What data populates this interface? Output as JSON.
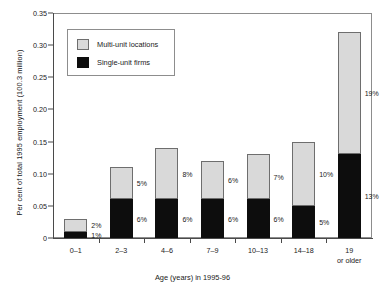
{
  "chart_data": {
    "type": "bar",
    "stacked": true,
    "title": "",
    "xlabel": "Age (years) in 1995-96",
    "ylabel": "Per cent of total 1995 employment (100.3 million)",
    "categories": [
      "0–1",
      "2–3",
      "4–6",
      "7–9",
      "10–13",
      "14–18",
      "19 or older"
    ],
    "ylim": [
      0,
      0.35
    ],
    "ytick_labels": [
      "0",
      "0.05",
      "0.10",
      "0.15",
      "0.20",
      "0.25",
      "0.30",
      "0.35"
    ],
    "ytick_values": [
      0,
      0.05,
      0.1,
      0.15,
      0.2,
      0.25,
      0.3,
      0.35
    ],
    "grid": false,
    "legend_position": "upper-left-inside",
    "series": [
      {
        "name": "Single-unit firms",
        "color": "#0d0d0d",
        "values": [
          0.01,
          0.06,
          0.06,
          0.06,
          0.06,
          0.05,
          0.13
        ],
        "labels": [
          "1%",
          "6%",
          "6%",
          "6%",
          "6%",
          "5%",
          "13%"
        ]
      },
      {
        "name": "Multi-unit locations",
        "color": "#d9d9d9",
        "values": [
          0.02,
          0.05,
          0.08,
          0.06,
          0.07,
          0.1,
          0.19
        ],
        "labels": [
          "2%",
          "5%",
          "8%",
          "6%",
          "7%",
          "10%",
          "19%"
        ]
      }
    ],
    "totals": [
      0.03,
      0.11,
      0.14,
      0.12,
      0.13,
      0.15,
      0.32
    ]
  },
  "legend": {
    "entries": [
      {
        "label": "Multi-unit locations",
        "swatch": "multi"
      },
      {
        "label": "Single-unit firms",
        "swatch": "single"
      }
    ]
  }
}
